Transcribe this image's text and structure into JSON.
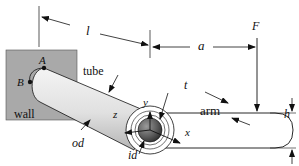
{
  "diagram": {
    "components": {
      "wall": "wall",
      "tube": "tube",
      "arm": "arm"
    },
    "points": {
      "A": "A",
      "B": "B"
    },
    "dimensions": {
      "length_tube": "l",
      "offset_arm": "a",
      "thickness": "t",
      "height": "h",
      "outer_diameter": "od",
      "inner_diameter": "id"
    },
    "load": {
      "force": "F"
    },
    "axes": {
      "x": "x",
      "y": "y",
      "z": "z"
    },
    "colors": {
      "wall_fill": "#a9a9a9",
      "line": "#111111",
      "tube_light": "#f2f2f2",
      "tube_dark": "#b8b8b8",
      "bore_dark": "#404040"
    }
  }
}
